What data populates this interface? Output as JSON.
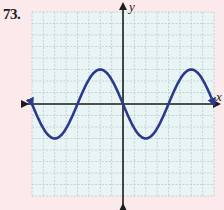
{
  "problem": {
    "number": "73."
  },
  "colors": {
    "page_background": "#fbe9ec",
    "grid_background": "#e9f5f5",
    "grid_line": "#b9c9cb",
    "axis": "#1c1c1c",
    "curve": "#2b3a8c"
  },
  "chart_data": {
    "type": "line",
    "title": "",
    "xlabel": "x",
    "ylabel": "y",
    "grid": true,
    "grid_cells": {
      "columns": 16,
      "rows": 16
    },
    "xlim": [
      -8,
      8
    ],
    "ylim": [
      -8,
      8
    ],
    "axis_arrows": true,
    "tick_labels": [],
    "legend": null,
    "series": [
      {
        "name": "curve",
        "description": "inverted sine wave y = -3 sin(pi x / 4), drawn with arrows at both ends",
        "function": "y = -3*sin(pi*x/4)",
        "x_range": [
          -8,
          8
        ],
        "points": [
          {
            "x": -8,
            "y": 0
          },
          {
            "x": -6,
            "y": -3
          },
          {
            "x": -4,
            "y": 0
          },
          {
            "x": -2,
            "y": 3
          },
          {
            "x": 0,
            "y": 0
          },
          {
            "x": 2,
            "y": -3
          },
          {
            "x": 4,
            "y": 0
          },
          {
            "x": 6,
            "y": 3
          },
          {
            "x": 8,
            "y": 0
          }
        ]
      }
    ]
  }
}
